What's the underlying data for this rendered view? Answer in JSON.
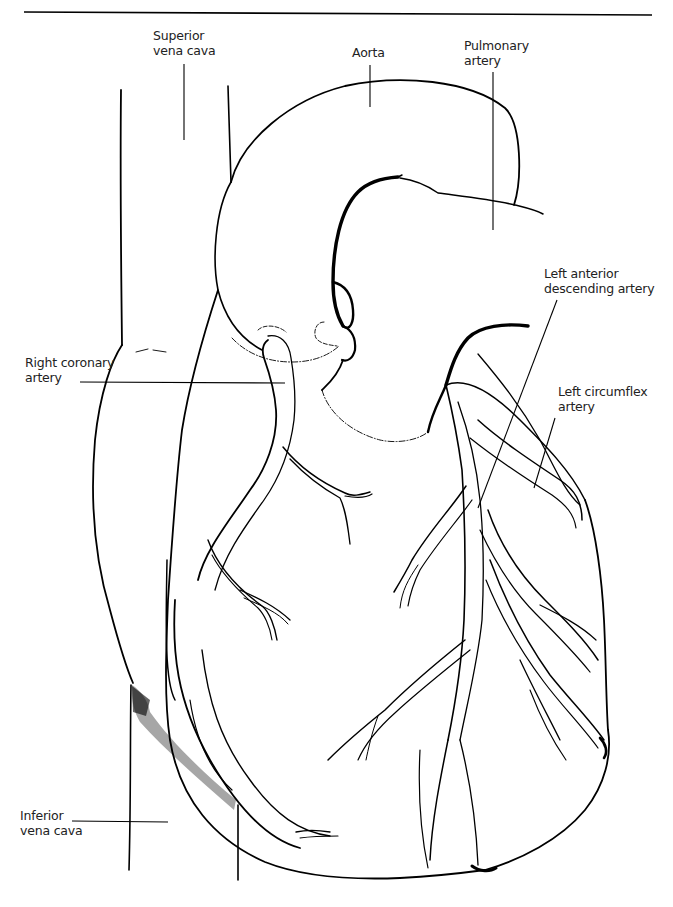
{
  "diagram": {
    "type": "anatomical-illustration",
    "colors": {
      "line": "#000000",
      "background": "#ffffff",
      "label": "#222222"
    },
    "labels": [
      {
        "id": "superior-vena-cava",
        "line1": "Superior",
        "line2": "vena cava"
      },
      {
        "id": "aorta",
        "line1": "Aorta",
        "line2": ""
      },
      {
        "id": "pulmonary-artery",
        "line1": "Pulmonary",
        "line2": "artery"
      },
      {
        "id": "left-anterior-descending-artery",
        "line1": "Left anterior",
        "line2": "descending artery"
      },
      {
        "id": "right-coronary-artery",
        "line1": "Right coronary",
        "line2": "artery"
      },
      {
        "id": "left-circumflex-artery",
        "line1": "Left circumflex",
        "line2": "artery"
      },
      {
        "id": "inferior-vena-cava",
        "line1": "Inferior",
        "line2": "vena cava"
      }
    ]
  }
}
